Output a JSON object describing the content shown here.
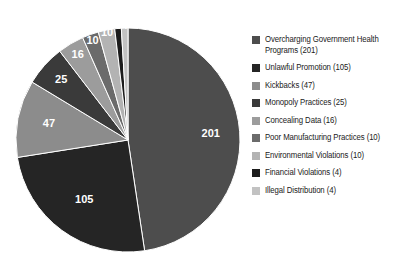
{
  "chart_data": {
    "type": "pie",
    "title": "",
    "categories": [
      "Overcharging Government Health Programs",
      "Unlawful Promotion",
      "Kickbacks",
      "Monopoly Practices",
      "Concealing Data",
      "Poor Manufacturing Practices",
      "Environmental Violations",
      "Financial Violations",
      "Illegal Distribution"
    ],
    "values": [
      201,
      105,
      47,
      25,
      16,
      10,
      10,
      4,
      4
    ],
    "total": 422,
    "start_angle_deg": 0,
    "direction": "clockwise",
    "legend_position": "right",
    "grid": false,
    "colors": [
      "#4d4d4d",
      "#252525",
      "#8c8c8c",
      "#3a3a3a",
      "#9c9c9c",
      "#6b6b6b",
      "#b3b3b3",
      "#1c1c1c",
      "#c2c2c2"
    ],
    "slice_label_color": "#ffffff",
    "background": "#ffffff"
  },
  "legend": {
    "items": [
      {
        "label": "Overcharging Government Health Programs (201)",
        "color": "#4d4d4d"
      },
      {
        "label": "Unlawful Promotion (105)",
        "color": "#252525"
      },
      {
        "label": "Kickbacks (47)",
        "color": "#8c8c8c"
      },
      {
        "label": "Monopoly Practices (25)",
        "color": "#3a3a3a"
      },
      {
        "label": "Concealing Data (16)",
        "color": "#9c9c9c"
      },
      {
        "label": "Poor Manufacturing Practices (10)",
        "color": "#6b6b6b"
      },
      {
        "label": "Environmental Violations (10)",
        "color": "#b3b3b3"
      },
      {
        "label": "Financial Violations (4)",
        "color": "#1c1c1c"
      },
      {
        "label": "Illegal Distribution (4)",
        "color": "#c2c2c2"
      }
    ]
  },
  "slice_labels": [
    "201",
    "105",
    "47",
    "25",
    "16",
    "10",
    "10",
    "4",
    "4"
  ],
  "geometry": {
    "cx": 128,
    "cy": 140,
    "r": 112
  }
}
